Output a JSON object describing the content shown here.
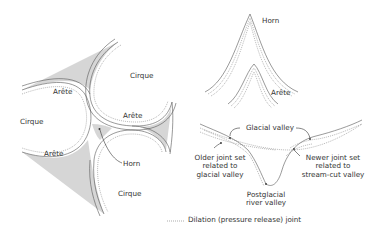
{
  "left_diagram": {
    "labels": {
      "cirque_top": "Cirque",
      "cirque_left": "Cirque",
      "cirque_bottom": "Cirque",
      "arete_upper_left": "Arête",
      "arete_center": "Arête",
      "arete_lower_left": "Arête",
      "horn": "Horn"
    }
  },
  "top_right_diagram": {
    "labels": {
      "horn": "Horn",
      "arete": "Arête"
    }
  },
  "bottom_right_diagram": {
    "labels": {
      "glacial_valley": "Glacial valley",
      "older_joint_line1": "Older joint set",
      "older_joint_line2": "related to",
      "older_joint_line3": "glacial valley",
      "newer_joint_line1": "Newer joint set",
      "newer_joint_line2": "related to",
      "newer_joint_line3": "stream-cut valley",
      "postglacial_line1": "Postglacial",
      "postglacial_line2": "river valley"
    }
  },
  "legend": {
    "label": "Dilation (pressure release) joint",
    "line_style": "dotted"
  },
  "colors": {
    "shade": "#d6d6d6",
    "line": "#555555",
    "dot": "#888888",
    "text": "#333333"
  }
}
